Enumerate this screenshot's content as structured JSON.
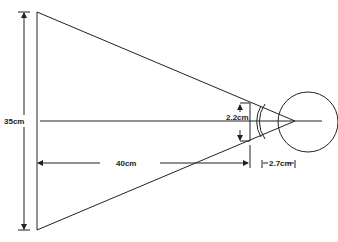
{
  "diagram": {
    "type": "visual-angle-geometry",
    "labels": {
      "screen_height": "35cm",
      "viewing_distance": "40cm",
      "retinal_image_height": "2.2cm",
      "eye_depth": "2.7cm"
    },
    "colors": {
      "stroke": "#222222",
      "background": "#ffffff"
    }
  }
}
